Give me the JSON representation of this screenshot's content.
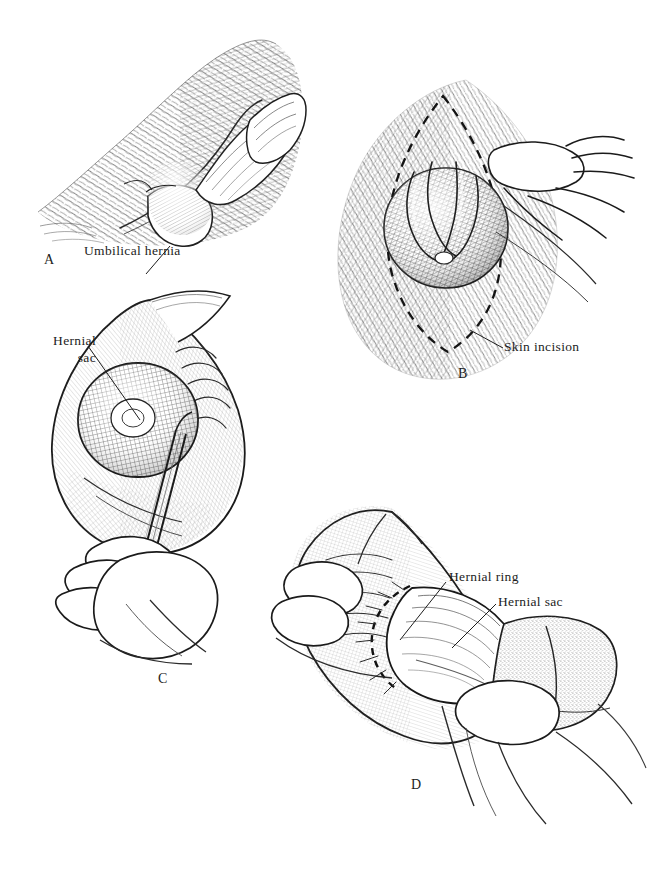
{
  "figure": {
    "background_color": "#ffffff",
    "ink_color": "#1d1d1d",
    "panel_count": 4
  },
  "panels": [
    {
      "letter": "A",
      "name": "lateral-view-umbilical-hernia",
      "description": "Lateral view of the haired abdominal wall showing the ventral hernia protrusion",
      "labels": [
        {
          "text": "Umbilical hernia",
          "name": "umbilical-hernia-label"
        }
      ]
    },
    {
      "letter": "B",
      "name": "skin-incision-planning",
      "description": "Hernia elevated by the surgeon's hand with the elliptical skin incision marked by a dashed line",
      "labels": [
        {
          "text": "Skin incision",
          "name": "skin-incision-label"
        }
      ]
    },
    {
      "letter": "C",
      "name": "hernial-sac-dissection",
      "description": "Skin reflected, hernial sac exposed and dissected with forceps",
      "labels": [
        {
          "text": "Hernial",
          "text2": "sac",
          "name": "hernial-sac-label"
        }
      ]
    },
    {
      "letter": "D",
      "name": "hernial-ring-exposure",
      "description": "Hernial sac reduced through the hernial ring, gauze sponge retracting tissue",
      "labels": [
        {
          "text": "Hernial ring",
          "name": "hernial-ring-label"
        },
        {
          "text": "Hernial sac",
          "name": "hernial-sac-label-d"
        }
      ]
    }
  ],
  "labels": {
    "umbilical_hernia": "Umbilical hernia",
    "skin_incision": "Skin incision",
    "hernial_line1": "Hernial",
    "hernial_line2": "sac",
    "hernial_ring": "Hernial ring",
    "hernial_sac_d": "Hernial sac",
    "letter_a": "A",
    "letter_b": "B",
    "letter_c": "C",
    "letter_d": "D"
  }
}
